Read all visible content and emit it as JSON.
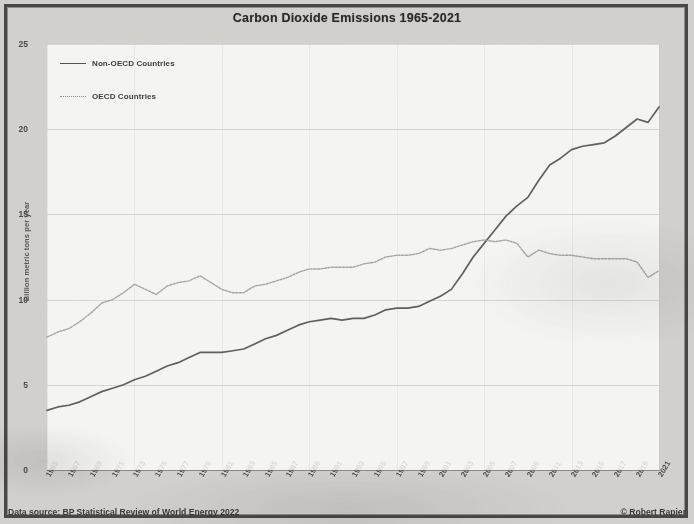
{
  "chart_data": {
    "type": "line",
    "title": "Carbon Dioxide Emissions 1965-2021",
    "xlabel": "",
    "ylabel": "Billion metric tons per year",
    "ylim": [
      0,
      25
    ],
    "yticks": [
      0,
      5,
      10,
      15,
      20,
      25
    ],
    "xlim": [
      1965,
      2021
    ],
    "grid": true,
    "legend_position": "top-left",
    "x": [
      1965,
      1966,
      1967,
      1968,
      1969,
      1970,
      1971,
      1972,
      1973,
      1974,
      1975,
      1976,
      1977,
      1978,
      1979,
      1980,
      1981,
      1982,
      1983,
      1984,
      1985,
      1986,
      1987,
      1988,
      1989,
      1990,
      1991,
      1992,
      1993,
      1994,
      1995,
      1996,
      1997,
      1998,
      1999,
      2000,
      2001,
      2002,
      2003,
      2004,
      2005,
      2006,
      2007,
      2008,
      2009,
      2010,
      2011,
      2012,
      2013,
      2014,
      2015,
      2016,
      2017,
      2018,
      2019,
      2020,
      2021
    ],
    "xticks": [
      "1965",
      "1967",
      "1969",
      "1971",
      "1973",
      "1975",
      "1977",
      "1979",
      "1981",
      "1983",
      "1985",
      "1987",
      "1989",
      "1991",
      "1993",
      "1995",
      "1997",
      "1999",
      "2001",
      "2003",
      "2005",
      "2007",
      "2009",
      "2011",
      "2013",
      "2015",
      "2017",
      "2019",
      "2021"
    ],
    "series": [
      {
        "name": "Non-OECD Countries",
        "style": "solid",
        "color": "#56534f",
        "values": [
          3.5,
          3.7,
          3.8,
          4.0,
          4.3,
          4.6,
          4.8,
          5.0,
          5.3,
          5.5,
          5.8,
          6.1,
          6.3,
          6.6,
          6.9,
          6.9,
          6.9,
          7.0,
          7.1,
          7.4,
          7.7,
          7.9,
          8.2,
          8.5,
          8.7,
          8.8,
          8.9,
          8.8,
          8.9,
          8.9,
          9.1,
          9.4,
          9.5,
          9.5,
          9.6,
          9.9,
          10.2,
          10.6,
          11.5,
          12.5,
          13.3,
          14.1,
          14.9,
          15.5,
          16.0,
          17.0,
          17.9,
          18.3,
          18.8,
          19.0,
          19.1,
          19.2,
          19.6,
          20.1,
          20.6,
          20.4,
          21.3
        ]
      },
      {
        "name": "OECD Countries",
        "style": "dotted",
        "color": "#9a9894",
        "values": [
          7.8,
          8.1,
          8.3,
          8.7,
          9.2,
          9.8,
          10.0,
          10.4,
          10.9,
          10.6,
          10.3,
          10.8,
          11.0,
          11.1,
          11.4,
          11.0,
          10.6,
          10.4,
          10.4,
          10.8,
          10.9,
          11.1,
          11.3,
          11.6,
          11.8,
          11.8,
          11.9,
          11.9,
          11.9,
          12.1,
          12.2,
          12.5,
          12.6,
          12.6,
          12.7,
          13.0,
          12.9,
          13.0,
          13.2,
          13.4,
          13.5,
          13.4,
          13.5,
          13.3,
          12.5,
          12.9,
          12.7,
          12.6,
          12.6,
          12.5,
          12.4,
          12.4,
          12.4,
          12.4,
          12.2,
          11.3,
          11.7
        ]
      }
    ],
    "source": "Data source: BP Statistical Review of World Energy 2022",
    "credit": "© Robert Rapier"
  },
  "footer": {
    "source": "Data source: BP Statistical Review of World Energy 2022",
    "credit": "© Robert Rapier"
  }
}
